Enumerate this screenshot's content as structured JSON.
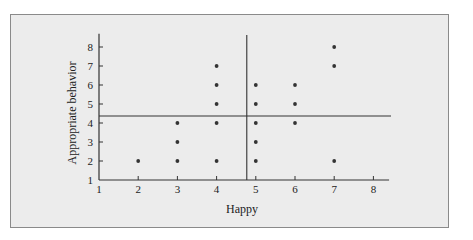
{
  "chart_data": {
    "type": "scatter",
    "title": "",
    "xlabel": "Happy",
    "ylabel": "Appropriate behavior",
    "xlim": [
      1,
      8.4
    ],
    "ylim": [
      1,
      8.7
    ],
    "x_ticks": [
      "1",
      "2",
      "3",
      "4",
      "5",
      "6",
      "7",
      "8"
    ],
    "y_ticks": [
      "1",
      "2",
      "3",
      "4",
      "5",
      "6",
      "7",
      "8"
    ],
    "grid": false,
    "legend": null,
    "points": [
      {
        "x": 2,
        "y": 2
      },
      {
        "x": 3,
        "y": 2
      },
      {
        "x": 3,
        "y": 3
      },
      {
        "x": 3,
        "y": 4
      },
      {
        "x": 4,
        "y": 2
      },
      {
        "x": 4,
        "y": 4
      },
      {
        "x": 4,
        "y": 5
      },
      {
        "x": 4,
        "y": 6
      },
      {
        "x": 4,
        "y": 7
      },
      {
        "x": 5,
        "y": 2
      },
      {
        "x": 5,
        "y": 3
      },
      {
        "x": 5,
        "y": 4
      },
      {
        "x": 5,
        "y": 5
      },
      {
        "x": 5,
        "y": 6
      },
      {
        "x": 6,
        "y": 4
      },
      {
        "x": 6,
        "y": 5
      },
      {
        "x": 6,
        "y": 6
      },
      {
        "x": 7,
        "y": 2
      },
      {
        "x": 7,
        "y": 7
      },
      {
        "x": 7,
        "y": 8
      }
    ],
    "reference_lines": {
      "vertical_x": 4.77,
      "horizontal_y": 4.37
    }
  },
  "labels": {
    "xlabel": "Happy",
    "ylabel": "Appropriate behavior"
  }
}
